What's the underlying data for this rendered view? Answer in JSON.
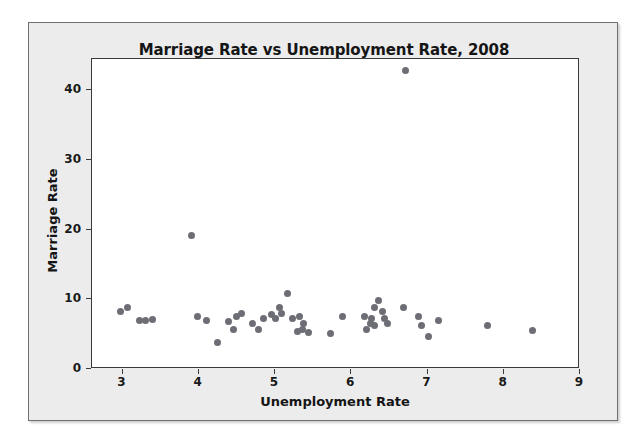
{
  "chart_data": {
    "type": "scatter",
    "title": "Marriage Rate vs Unemployment Rate, 2008",
    "xlabel": "Unemployment Rate",
    "ylabel": "Marriage Rate",
    "xlim": [
      2.6,
      9.0
    ],
    "ylim": [
      0,
      44.5
    ],
    "xticks": [
      3,
      4,
      5,
      6,
      7,
      8,
      9
    ],
    "xtick_labels": [
      "3",
      "4",
      "5",
      "6",
      "7",
      "8",
      "9"
    ],
    "yticks": [
      0,
      10,
      20,
      30,
      40
    ],
    "ytick_labels": [
      "0",
      "10",
      "20",
      "30",
      "40"
    ],
    "grid": false,
    "legend": null,
    "marker": {
      "shape": "circle",
      "color": "#6d6d75",
      "size_px": 7
    },
    "series": [
      {
        "name": "States",
        "points": [
          [
            2.97,
            8.2
          ],
          [
            3.07,
            8.8
          ],
          [
            3.22,
            6.9
          ],
          [
            3.3,
            6.9
          ],
          [
            3.39,
            7.1
          ],
          [
            3.9,
            19.2
          ],
          [
            3.99,
            7.5
          ],
          [
            4.1,
            7.0
          ],
          [
            4.25,
            3.8
          ],
          [
            4.39,
            6.8
          ],
          [
            4.45,
            5.7
          ],
          [
            4.5,
            7.5
          ],
          [
            4.56,
            8.0
          ],
          [
            4.7,
            6.5
          ],
          [
            4.78,
            5.7
          ],
          [
            4.85,
            7.2
          ],
          [
            4.95,
            7.8
          ],
          [
            5.01,
            7.2
          ],
          [
            5.06,
            8.8
          ],
          [
            5.08,
            8.0
          ],
          [
            5.16,
            10.9
          ],
          [
            5.23,
            7.2
          ],
          [
            5.32,
            7.5
          ],
          [
            5.38,
            6.5
          ],
          [
            5.3,
            5.4
          ],
          [
            5.36,
            5.7
          ],
          [
            5.44,
            5.2
          ],
          [
            5.73,
            5.1
          ],
          [
            5.88,
            7.5
          ],
          [
            6.17,
            7.5
          ],
          [
            6.2,
            5.7
          ],
          [
            6.25,
            6.5
          ],
          [
            6.27,
            7.2
          ],
          [
            6.3,
            6.3
          ],
          [
            6.31,
            8.8
          ],
          [
            6.36,
            9.8
          ],
          [
            6.41,
            8.2
          ],
          [
            6.44,
            7.2
          ],
          [
            6.48,
            6.5
          ],
          [
            6.71,
            42.9
          ],
          [
            6.69,
            8.8
          ],
          [
            6.88,
            7.5
          ],
          [
            6.92,
            6.3
          ],
          [
            7.01,
            4.6
          ],
          [
            7.14,
            6.9
          ],
          [
            7.79,
            6.3
          ],
          [
            8.38,
            5.5
          ]
        ]
      }
    ]
  }
}
